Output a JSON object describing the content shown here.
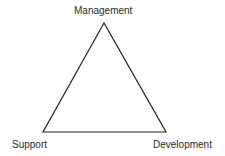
{
  "diagram": {
    "type": "triangle",
    "vertices": {
      "top": {
        "label": "Management",
        "x": 104,
        "y": 23
      },
      "bottom_left": {
        "label": "Support",
        "x": 43,
        "y": 132
      },
      "bottom_right": {
        "label": "Development",
        "x": 166,
        "y": 132
      }
    },
    "stroke_color": "#222222",
    "background": "#ffffff"
  }
}
